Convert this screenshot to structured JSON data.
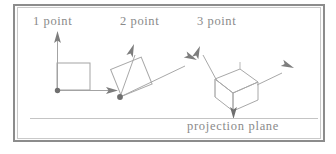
{
  "figure": {
    "kind": "technical-line-diagram",
    "labels": {
      "one_point": "1 point",
      "two_point": "2 point",
      "three_point": "3 point",
      "projection_plane": "projection plane"
    },
    "colors": {
      "line": "#9a9a9a",
      "dark_line": "#6f6f6f",
      "text": "#8a8a8a",
      "outer_frame": "#8c8c8c",
      "inner_frame": "#c9c9c9",
      "page": "#ffffff"
    },
    "panels": [
      {
        "name": "one-point",
        "label": "1 point",
        "shape": "square-front-face",
        "vanishing_points": 1,
        "axes": [
          {
            "name": "vertical-axis-arrow",
            "direction": "up"
          },
          {
            "name": "horizontal-axis-arrow",
            "direction": "right"
          }
        ],
        "station_point": "bottom-left-corner"
      },
      {
        "name": "two-point",
        "label": "2 point",
        "shape": "rotated-square",
        "rotation_degrees": 22,
        "vanishing_points": 2,
        "axes": [
          {
            "name": "left-axis-arrow",
            "direction": "up-left"
          },
          {
            "name": "right-axis-arrow",
            "direction": "up-right"
          }
        ],
        "station_point": "bottom-corner"
      },
      {
        "name": "three-point",
        "label": "3 point",
        "shape": "wireframe-cube",
        "vanishing_points": 3,
        "axes": [
          {
            "name": "left-axis-arrow",
            "direction": "up-left"
          },
          {
            "name": "right-axis-arrow",
            "direction": "right"
          },
          {
            "name": "down-axis-arrow",
            "direction": "down"
          }
        ],
        "station_point": "bottom-corner"
      }
    ],
    "projection_plane": {
      "label": "projection plane",
      "line": "horizontal-rule-near-bottom"
    }
  }
}
